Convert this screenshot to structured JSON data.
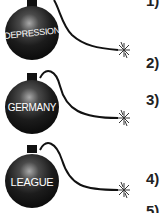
{
  "bombs": [
    {
      "label": "DEPRESSION",
      "cx": 32,
      "cy": 32,
      "r": 27,
      "spark_x": 124,
      "spark_y": 50
    },
    {
      "label": "GERMANY",
      "cx": 32,
      "cy": 106,
      "r": 27,
      "spark_x": 124,
      "spark_y": 118
    },
    {
      "label": "LEAGUE",
      "cx": 32,
      "cy": 180,
      "r": 27,
      "spark_x": 124,
      "spark_y": 190
    }
  ],
  "numbers": [
    "1)",
    "2)",
    "3)",
    "4)",
    "5)"
  ],
  "colors": {
    "bomb": "#1a1a1a",
    "highlight": "#9a9a9a",
    "text": "#ffffff",
    "fuse": "#111111"
  }
}
